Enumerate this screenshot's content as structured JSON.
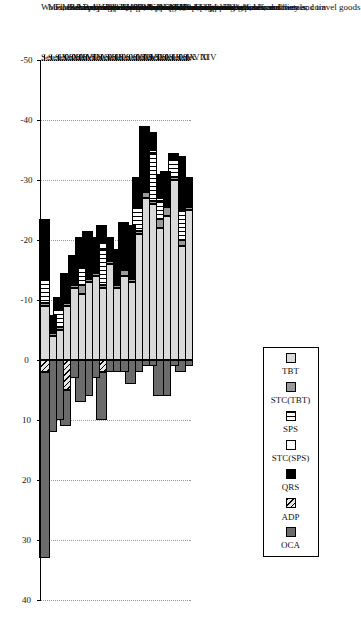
{
  "chart_data": {
    "type": "bar",
    "orientation": "horizontal-stacked",
    "title": "",
    "xlabel": "",
    "ylabel": "",
    "xlim": [
      -50,
      40
    ],
    "xticks": [
      -50,
      -40,
      -30,
      -20,
      -10,
      0,
      10,
      20,
      30,
      40
    ],
    "xticklabels": [
      "-50",
      "-40",
      "-30",
      "-20",
      "-10",
      "0",
      "10",
      "20",
      "30",
      "40"
    ],
    "grid": true,
    "grid_axis": "x",
    "legend_position": "top-right",
    "legend": [
      "TBT",
      "STC(TBT)",
      "SPS",
      "STC(SPS)",
      "QRS",
      "ADP",
      "OCA"
    ],
    "series_patterns": {
      "TBT": "checkered-dots",
      "STC(TBT)": "solid-gray",
      "SPS": "vertical-lines",
      "STC(SPS)": "white-empty",
      "QRS": "solid-black",
      "ADP": "diagonal-hatch",
      "OCA": "solid-dark-gray"
    },
    "categories_short": [
      "Sec. XIV",
      "Sec. VIII",
      "Sec. V",
      "Sec. XIX",
      "Sec. III",
      "Sec. I",
      "Sec. XXI",
      "Sec. VI",
      "Sec. XVII",
      "Sec. XI",
      "Sec. XVIII",
      "Sec. X",
      "Sec. II",
      "Sec. XIII",
      "Sec. XV",
      "Sec. IV",
      "Sec. VII",
      "Sec. XVI",
      "Sec. XII",
      "Sec. XX",
      "Sec. IX"
    ],
    "categories_long": [
      "Pearls, precious stones and metals; coin",
      "Hides, skins and articles; saddlery and travel goods",
      "Mineral products",
      "Arms and ammunition",
      "Animal and vegetable fats, oils and waxes",
      "Live animals and products",
      "Works of art and antiques",
      "Products of the chemical and allied industries",
      "Vehicles, aircraft and vessels",
      "Textiles and articles",
      "Instruments, clocks, recorders and reproducers",
      "Paper, paperboard and articles",
      "Vegetable products",
      "Articles of stone, plaster; ceramic prod.; glass",
      "Base metals and articles",
      "Prepared foodstuff; beverages, spirits, vinegar; tobacco",
      "Resins, plastics and articles; rubber and articles",
      "Machinery and electrical equipment",
      "Footwear, headgear; feathers, artif. flowers, fans",
      "Miscellaneous manufactured articles",
      "Wood, cork and articles; basketware"
    ],
    "series": [
      {
        "name": "TBT",
        "values": [
          -25.0,
          -19.0,
          -30.0,
          -24.0,
          -22.0,
          -26.0,
          -27.0,
          -21.0,
          -13.0,
          -14.0,
          -12.0,
          -16.0,
          -12.0,
          -14.0,
          -13.0,
          -11.0,
          -12.0,
          -9.0,
          -5.0,
          -4.0,
          -9.0
        ]
      },
      {
        "name": "STC(TBT)",
        "values": [
          -0.5,
          -1.0,
          -0.5,
          -1.5,
          -1.5,
          -0.5,
          -1.0,
          -0.5,
          -0.5,
          -1.0,
          -0.5,
          -0.5,
          -0.5,
          -0.5,
          -0.5,
          -1.5,
          -0.5,
          -0.5,
          -0.5,
          -0.5,
          -0.5
        ]
      },
      {
        "name": "SPS",
        "values": [
          0.0,
          -5.0,
          -3.0,
          0.0,
          -3.0,
          -8.0,
          0.0,
          -4.0,
          0.0,
          0.0,
          0.0,
          0.0,
          -6.0,
          0.0,
          0.0,
          -3.0,
          0.0,
          0.0,
          -3.0,
          0.0,
          -4.0
        ]
      },
      {
        "name": "STC(SPS)",
        "values": [
          0.0,
          0.0,
          0.0,
          0.0,
          -0.5,
          -0.5,
          0.0,
          0.0,
          0.0,
          0.0,
          0.0,
          0.0,
          -1.0,
          0.0,
          0.0,
          0.0,
          0.0,
          0.0,
          0.0,
          0.0,
          0.0
        ]
      },
      {
        "name": "QRS",
        "values": [
          -5.0,
          -9.0,
          -1.0,
          -6.0,
          -4.0,
          -3.0,
          -11.0,
          -5.0,
          -9.0,
          -8.0,
          -6.0,
          -4.0,
          -3.0,
          -6.0,
          -8.0,
          -5.0,
          -5.0,
          -5.0,
          -2.0,
          -3.0,
          -10.0
        ]
      },
      {
        "name": "ADP",
        "values": [
          0.0,
          0.0,
          0.0,
          0.0,
          0.0,
          0.0,
          0.0,
          0.0,
          0.0,
          0.0,
          0.0,
          0.0,
          2.0,
          0.0,
          0.0,
          0.0,
          0.0,
          5.0,
          0.0,
          0.0,
          2.0
        ]
      },
      {
        "name": "OCA",
        "values": [
          1.0,
          2.0,
          1.0,
          6.0,
          6.0,
          1.0,
          1.0,
          2.0,
          4.0,
          2.0,
          2.0,
          2.0,
          8.0,
          3.0,
          6.0,
          7.0,
          3.0,
          6.0,
          10.0,
          12.0,
          31.0
        ]
      }
    ]
  },
  "legend": {
    "items": [
      {
        "label": "TBT",
        "pattern": "f-tbt"
      },
      {
        "label": "STC(TBT)",
        "pattern": "f-stctbt"
      },
      {
        "label": "SPS",
        "pattern": "f-sps"
      },
      {
        "label": "STC(SPS)",
        "pattern": "f-stcsps"
      },
      {
        "label": "QRS",
        "pattern": "f-qrs"
      },
      {
        "label": "ADP",
        "pattern": "f-adp"
      },
      {
        "label": "OCA",
        "pattern": "f-oca"
      }
    ]
  }
}
